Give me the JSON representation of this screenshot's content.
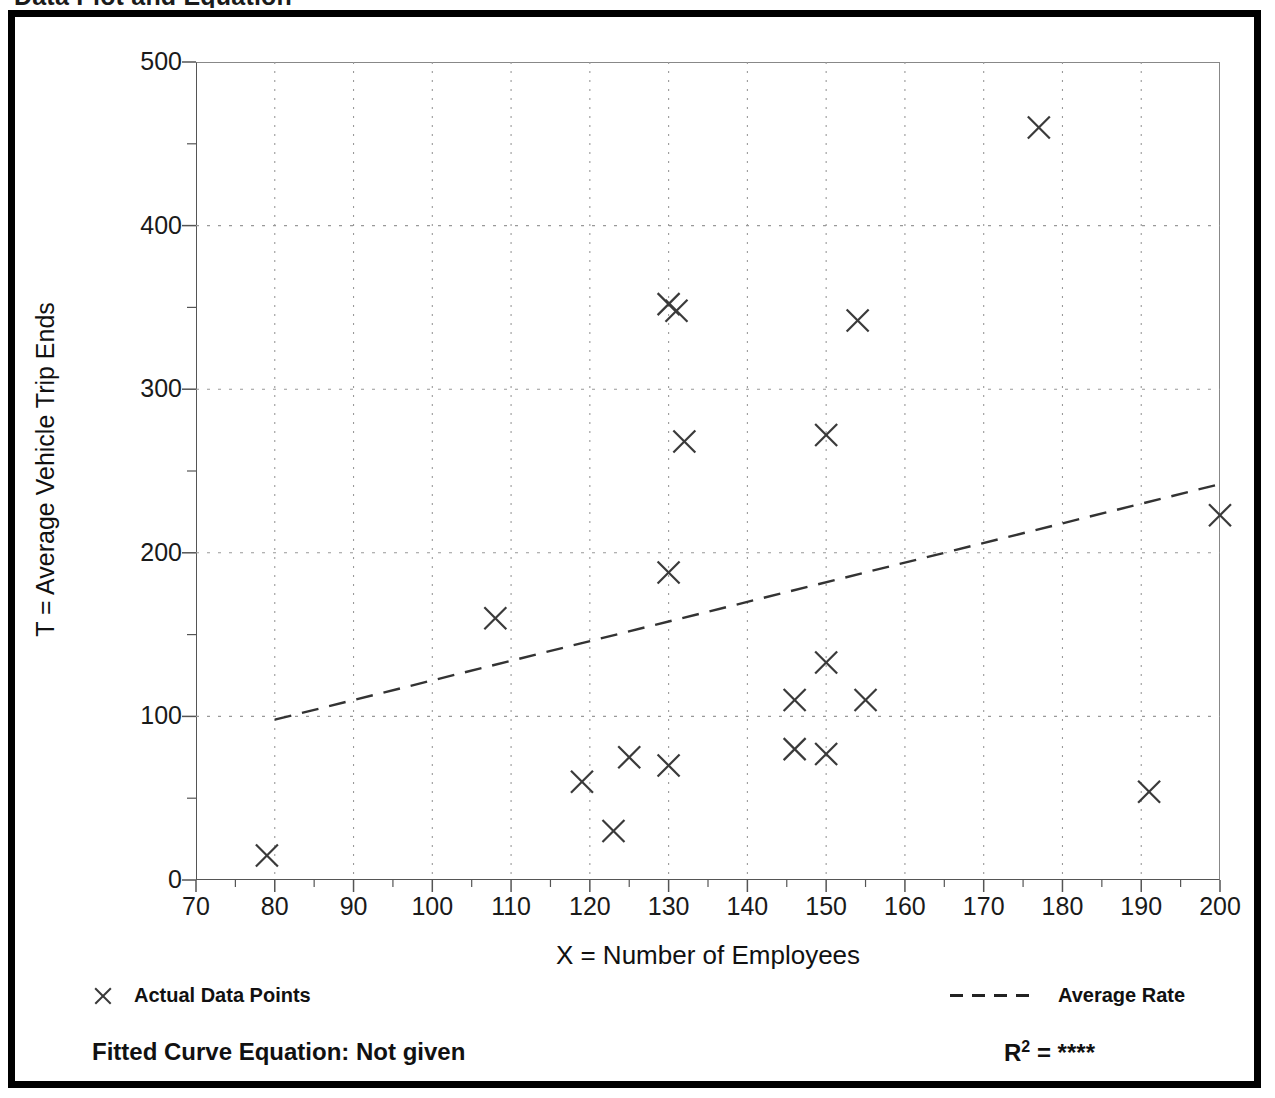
{
  "figure": {
    "title": "Data Plot and Equation"
  },
  "axes": {
    "x_title": "X = Number of Employees",
    "y_title": "T = Average Vehicle Trip Ends",
    "x_ticks": [
      "70",
      "80",
      "90",
      "100",
      "110",
      "120",
      "130",
      "140",
      "150",
      "160",
      "170",
      "180",
      "190",
      "200"
    ],
    "y_ticks": [
      "0",
      "100",
      "200",
      "300",
      "400",
      "500"
    ]
  },
  "legend": {
    "points_label": "Actual Data Points",
    "points_marker": "x-marker-icon",
    "line_label": "Average Rate",
    "line_marker": "dashed-line-icon"
  },
  "footer": {
    "fitted_curve_label": "Fitted Curve Equation:  Not given",
    "r2_prefix": "R",
    "r2_exponent": "2",
    "r2_value": "= ****"
  },
  "colors": {
    "marker": "#3a3a3a",
    "trend_line": "#333333",
    "grid": "#999999",
    "axis": "#555555",
    "frame": "#000000",
    "text": "#111111"
  },
  "chart_data": {
    "type": "scatter",
    "title": "Data Plot and Equation",
    "xlabel": "X = Number of Employees",
    "ylabel": "T = Average Vehicle Trip Ends",
    "xlim": [
      70,
      200
    ],
    "ylim": [
      0,
      500
    ],
    "x_major_step": 10,
    "x_minor_step": 5,
    "y_major_step": 100,
    "y_minor_step": 50,
    "grid": true,
    "legend_position": "below-axes",
    "series": [
      {
        "name": "Actual Data Points",
        "type": "scatter",
        "marker": "x",
        "points": [
          [
            79,
            15
          ],
          [
            108,
            160
          ],
          [
            119,
            60
          ],
          [
            123,
            30
          ],
          [
            125,
            75
          ],
          [
            130,
            70
          ],
          [
            130,
            188
          ],
          [
            130,
            352
          ],
          [
            131,
            348
          ],
          [
            132,
            268
          ],
          [
            146,
            110
          ],
          [
            146,
            80
          ],
          [
            150,
            77
          ],
          [
            150,
            133
          ],
          [
            150,
            272
          ],
          [
            154,
            342
          ],
          [
            155,
            110
          ],
          [
            177,
            460
          ],
          [
            191,
            54
          ],
          [
            200,
            223
          ]
        ]
      },
      {
        "name": "Average Rate",
        "type": "line",
        "style": "dashed",
        "x": [
          80,
          200
        ],
        "y": [
          98,
          242
        ]
      }
    ],
    "annotations": [
      "Fitted Curve Equation:  Not given",
      "R2 = ****"
    ]
  }
}
